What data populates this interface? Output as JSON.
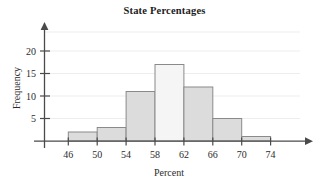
{
  "chart_data": {
    "type": "bar",
    "title": "State Percentages",
    "xlabel": "Percent",
    "ylabel": "Frequency",
    "categories": [
      "46-50",
      "50-54",
      "54-58",
      "58-62",
      "62-66",
      "66-70",
      "70-74"
    ],
    "bin_edges": [
      46,
      50,
      54,
      58,
      62,
      66,
      70,
      74
    ],
    "values": [
      2,
      3,
      11,
      17,
      12,
      5,
      1
    ],
    "bin_width": 4,
    "x_ticks": [
      46,
      50,
      54,
      58,
      62,
      66,
      70,
      74
    ],
    "y_ticks": [
      5,
      10,
      15,
      20
    ],
    "xlim": [
      46,
      74
    ],
    "ylim": [
      0,
      22
    ],
    "grid": true,
    "legend": "none",
    "bar_colors": [
      "#dcdcdc",
      "#dcdcdc",
      "#dcdcdc",
      "#f5f5f5",
      "#dcdcdc",
      "#dcdcdc",
      "#dcdcdc"
    ],
    "bar_edge_color": "#8a8a8a",
    "axis_color": "#4a4a4a",
    "grid_color": "#ededed",
    "title_color": "#1c1c1c"
  },
  "axes": {
    "x_tick_labels": [
      "46",
      "50",
      "54",
      "58",
      "62",
      "66",
      "70",
      "74"
    ],
    "y_tick_labels": [
      "5",
      "10",
      "15",
      "20"
    ],
    "x_axis_title": "Percent",
    "y_axis_title": "Frequency"
  }
}
